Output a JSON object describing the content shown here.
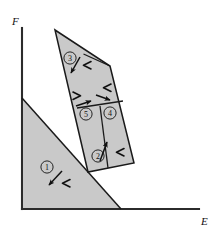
{
  "figure": {
    "type": "region-diagram",
    "title": "",
    "axes": {
      "x_label": "E",
      "y_label": "F",
      "x_axis_name": "horizontal-axis",
      "y_axis_name": "vertical-axis",
      "axis_color": "#2b2b2b"
    },
    "colors": {
      "fill": "#c9c9c9",
      "stroke": "#1a1a1a",
      "background": "#ffffff",
      "divider": "#1a1a1a"
    },
    "regions": [
      {
        "id": "1",
        "label": "①",
        "number": "1",
        "shape": "lower-left-triangle",
        "label_x": 47,
        "label_y": 167,
        "arrow": {
          "name": "arrow-region-1",
          "x1": 62,
          "y1": 172,
          "x2": 48,
          "y2": 186
        },
        "tick": {
          "name": "tick-region-1",
          "x": 65,
          "y": 183,
          "rotate": 0
        }
      },
      {
        "id": "2",
        "label": "②",
        "number": "2",
        "shape": "upper-polygon-lower-left-cell",
        "label_x": 99,
        "label_y": 157,
        "arrow": {
          "name": "arrow-region-2",
          "x1": 101,
          "y1": 162,
          "x2": 109,
          "y2": 143
        },
        "tick": {
          "name": "tick-region-2",
          "x": 119,
          "y": 153,
          "rotate": 0
        }
      },
      {
        "id": "3",
        "label": "③",
        "number": "3",
        "shape": "upper-polygon-top-cell",
        "label_x": 70,
        "label_y": 59,
        "arrow": {
          "name": "arrow-region-3",
          "x1": 80,
          "y1": 58,
          "x2": 71,
          "y2": 74
        },
        "tick": {
          "name": "tick-region-3",
          "x": 86,
          "y": 66,
          "rotate": 0
        }
      },
      {
        "id": "4",
        "label": "④",
        "number": "4",
        "shape": "upper-polygon-middle-right-cell",
        "label_x": 110,
        "label_y": 112,
        "arrow": {
          "name": "arrow-region-4",
          "x1": 98,
          "y1": 95,
          "x2": 111,
          "y2": 101
        },
        "tick": {
          "name": "tick-region-4",
          "x": 104,
          "y": 89,
          "rotate": 0
        }
      },
      {
        "id": "5",
        "label": "⑤",
        "number": "5",
        "shape": "upper-polygon-middle-left-cell",
        "label_x": 86,
        "label_y": 113,
        "arrow": {
          "name": "arrow-region-5",
          "x1": 78,
          "y1": 106,
          "x2": 92,
          "y2": 101
        },
        "tick": {
          "name": "tick-region-5",
          "x": 79,
          "y": 95,
          "rotate": 180
        }
      }
    ],
    "shapes": {
      "lower_triangle": "22,98 120,209 22,209",
      "upper_polygon": "55,30 110,66 134,163 88,172",
      "divider_3": "84,55 110,66",
      "divider_mid": "78,108 122,101",
      "divider_2": "107,166 100,114"
    }
  }
}
